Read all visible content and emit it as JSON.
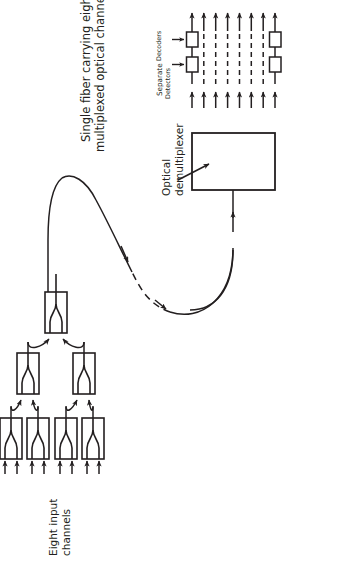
{
  "figure": {
    "kind": "diagram",
    "orientation_degrees": -90,
    "background_color": "#ffffff",
    "ink_color": "#231f20"
  },
  "labels": {
    "fiber_title_line1": "Single fiber carrying eight",
    "fiber_title_line2": "multiplexed optical channels",
    "demux_line1": "Optical",
    "demux_line2": "demultiplexer",
    "separate": "Separate",
    "detectors": "Detectors",
    "decoders": "Decoders",
    "inputs_line1": "Eight input",
    "inputs_line2": "channels"
  },
  "diagram_data": {
    "input_channel_count": 8,
    "output_channel_count": 8,
    "coupler_tree": {
      "stage_1_couplers": 4,
      "stage_2_couplers": 2,
      "stage_3_couplers": 1,
      "inputs_per_coupler": 2
    },
    "demultiplexer": {
      "label": "Optical demultiplexer",
      "outputs": 8
    },
    "detector_row": {
      "label": "Detectors",
      "drawn_boxes": 2,
      "implied_dashed": 6
    },
    "decoder_row": {
      "label": "Decoders",
      "drawn_boxes": 2,
      "implied_dashed": 6
    },
    "fiber_link": {
      "style": "solid-dashed-solid S-curve",
      "arrow_count": 3,
      "direction": "multiplexer to demultiplexer"
    }
  }
}
